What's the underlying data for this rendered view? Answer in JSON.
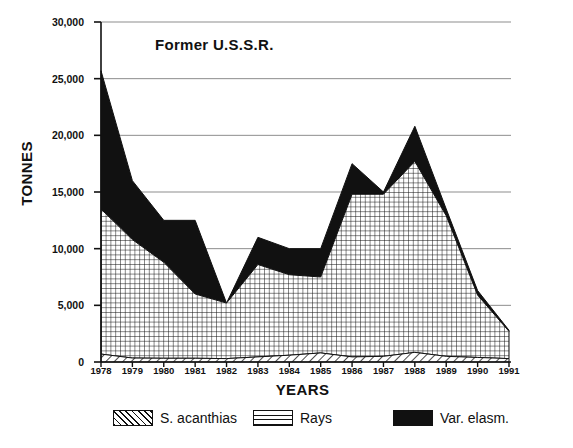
{
  "chart_data": {
    "type": "area",
    "title": "Former U.S.S.R.",
    "xlabel": "YEARS",
    "ylabel": "TONNES",
    "stacked": true,
    "grid": true,
    "legend_position": "bottom",
    "ylim": [
      0,
      30000
    ],
    "yticks": [
      0,
      5000,
      10000,
      15000,
      20000,
      25000,
      30000
    ],
    "ytick_labels": [
      "0",
      "5,000",
      "10,000",
      "15,000",
      "20,000",
      "25,000",
      "30,000"
    ],
    "x": [
      1978,
      1979,
      1980,
      1981,
      1982,
      1983,
      1984,
      1985,
      1986,
      1987,
      1988,
      1989,
      1990,
      1991
    ],
    "xtick_labels": [
      "1978",
      "1979",
      "1980",
      "1981",
      "1982",
      "1983",
      "1984",
      "1985",
      "1986",
      "1987",
      "1988",
      "1989",
      "1990",
      "1991"
    ],
    "series": [
      {
        "name": "S. acanthias",
        "pattern": "diagonal-hatch",
        "color": "#111111",
        "values": [
          700,
          350,
          330,
          330,
          300,
          450,
          600,
          800,
          450,
          500,
          850,
          500,
          400,
          300
        ]
      },
      {
        "name": "Rays",
        "pattern": "cross-hatch",
        "color": "#111111",
        "values": [
          12800,
          10450,
          8470,
          5670,
          4900,
          8150,
          7100,
          6700,
          14350,
          14300,
          16850,
          12400,
          5500,
          2400
        ]
      },
      {
        "name": "Var. elasm.",
        "pattern": "solid",
        "color": "#111111",
        "values": [
          12200,
          5200,
          3700,
          6500,
          0,
          2400,
          2300,
          2500,
          2700,
          200,
          3100,
          600,
          400,
          100
        ]
      }
    ],
    "totals": [
      25700,
      16000,
      12500,
      12500,
      5200,
      11000,
      10000,
      10000,
      17500,
      15000,
      20800,
      13500,
      6300,
      2800
    ],
    "rays_cumulative": [
      13500,
      10800,
      8800,
      6000,
      5200,
      8600,
      7700,
      7500,
      14800,
      14800,
      17700,
      12900,
      5900,
      2700
    ]
  },
  "legend": {
    "items": [
      {
        "label": "S. acanthias",
        "pattern": "diagonal-hatch"
      },
      {
        "label": "Rays",
        "pattern": "cross-hatch"
      },
      {
        "label": "Var. elasm.",
        "pattern": "solid"
      }
    ]
  }
}
